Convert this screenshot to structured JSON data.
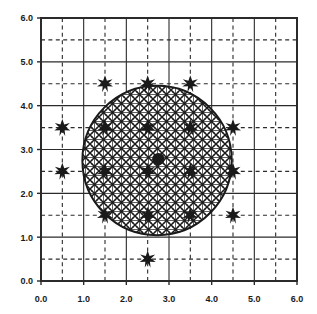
{
  "figure": {
    "background_color": "#ffffff",
    "foreground_color": "#1a1a1a",
    "frame_color": "#2b2b2b"
  },
  "axes": {
    "x": {
      "label": "",
      "min": 0.0,
      "max": 6.0,
      "major_step": 1.0,
      "minor_step": 0.5,
      "tick_labels": [
        "0.0",
        "1.0",
        "2.0",
        "3.0",
        "4.0",
        "5.0",
        "6.0"
      ],
      "tick_values": [
        0.0,
        1.0,
        2.0,
        3.0,
        4.0,
        5.0,
        6.0
      ]
    },
    "y": {
      "label": "",
      "min": 0.0,
      "max": 6.0,
      "major_step": 1.0,
      "minor_step": 0.5,
      "tick_labels": [
        "0.0",
        "1.0",
        "2.0",
        "3.0",
        "4.0",
        "5.0",
        "6.0"
      ],
      "tick_values": [
        0.0,
        1.0,
        2.0,
        3.0,
        4.0,
        5.0,
        6.0
      ]
    },
    "grid": {
      "major": {
        "visible": true,
        "style": "solid",
        "color": "#2b2b2b"
      },
      "minor": {
        "visible": true,
        "style": "dashed",
        "color": "#2b2b2b"
      }
    }
  },
  "chart_data": {
    "type": "scatter",
    "title": "",
    "xlabel": "",
    "ylabel": "",
    "xlim": [
      0.0,
      6.0
    ],
    "ylim": [
      0.0,
      6.0
    ],
    "grid": true,
    "legend": "none",
    "series": [
      {
        "name": "star-markers",
        "marker": "six-pointed-star",
        "color": "#1a1a1a",
        "points": [
          {
            "x": 1.5,
            "y": 4.5
          },
          {
            "x": 2.5,
            "y": 4.5
          },
          {
            "x": 3.5,
            "y": 4.5
          },
          {
            "x": 0.5,
            "y": 3.5
          },
          {
            "x": 1.5,
            "y": 3.5
          },
          {
            "x": 2.5,
            "y": 3.5
          },
          {
            "x": 3.5,
            "y": 3.5
          },
          {
            "x": 4.5,
            "y": 3.5
          },
          {
            "x": 0.5,
            "y": 2.5
          },
          {
            "x": 1.5,
            "y": 2.5
          },
          {
            "x": 2.5,
            "y": 2.5
          },
          {
            "x": 3.5,
            "y": 2.5
          },
          {
            "x": 4.5,
            "y": 2.5
          },
          {
            "x": 1.5,
            "y": 1.5
          },
          {
            "x": 2.5,
            "y": 1.5
          },
          {
            "x": 3.5,
            "y": 1.5
          },
          {
            "x": 4.5,
            "y": 1.5
          },
          {
            "x": 2.5,
            "y": 0.5
          }
        ]
      },
      {
        "name": "center-point",
        "marker": "filled-hexagon",
        "color": "#1a1a1a",
        "points": [
          {
            "x": 2.75,
            "y": 2.78
          }
        ]
      }
    ],
    "shapes": [
      {
        "name": "hatched-circle",
        "type": "circle",
        "cx": 2.72,
        "cy": 2.75,
        "r": 1.75,
        "fill": "hatch-pattern",
        "edge_color": "#1a1a1a",
        "edge_width": 1.6
      }
    ]
  }
}
